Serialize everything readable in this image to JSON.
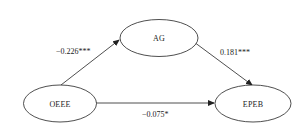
{
  "diagram": {
    "nodes": [
      {
        "id": "OEEE",
        "label": "OEEE"
      },
      {
        "id": "AG",
        "label": "AG"
      },
      {
        "id": "EPEB",
        "label": "EPEB"
      }
    ],
    "edges": [
      {
        "from": "OEEE",
        "to": "AG",
        "label": "−0.226***"
      },
      {
        "from": "AG",
        "to": "EPEB",
        "label": "0.181***"
      },
      {
        "from": "OEEE",
        "to": "EPEB",
        "label": "−0.075*"
      }
    ],
    "colors": {
      "stroke": "#222222",
      "background": "#ffffff"
    }
  }
}
